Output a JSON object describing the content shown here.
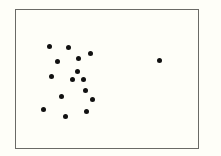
{
  "chart_data": {
    "type": "scatter",
    "title": "",
    "xlabel": "",
    "ylabel": "",
    "grid": false,
    "legend": null,
    "frame": {
      "left": 15,
      "top": 9,
      "right": 199,
      "bottom": 149
    },
    "dot_color": "#111111",
    "points": [
      {
        "x": 49,
        "y": 46
      },
      {
        "x": 68,
        "y": 47
      },
      {
        "x": 90,
        "y": 53
      },
      {
        "x": 78,
        "y": 58
      },
      {
        "x": 57,
        "y": 61
      },
      {
        "x": 77,
        "y": 71
      },
      {
        "x": 51,
        "y": 76
      },
      {
        "x": 72,
        "y": 79
      },
      {
        "x": 83,
        "y": 79
      },
      {
        "x": 85,
        "y": 90
      },
      {
        "x": 61,
        "y": 96
      },
      {
        "x": 92,
        "y": 99
      },
      {
        "x": 43,
        "y": 109
      },
      {
        "x": 86,
        "y": 111
      },
      {
        "x": 65,
        "y": 116
      },
      {
        "x": 159,
        "y": 60
      }
    ],
    "annotations": [
      "one outlier point at right"
    ]
  }
}
